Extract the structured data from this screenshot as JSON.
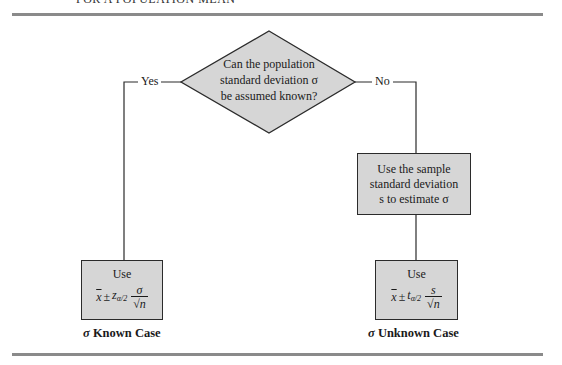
{
  "header": {
    "title": "FOR A POPULATION MEAN"
  },
  "decision": {
    "line1": "Can the population",
    "line2": "standard deviation σ",
    "line3": "be assumed known?"
  },
  "branches": {
    "yes_label": "Yes",
    "no_label": "No"
  },
  "process_box": {
    "line1": "Use the sample",
    "line2": "standard deviation",
    "line3": "s to estimate σ"
  },
  "known_case": {
    "use_label": "Use",
    "xbar": "x",
    "plusminus": "±",
    "critical_var": "z",
    "critical_sub": "α/2",
    "numerator": "σ",
    "sqrt_symbol": "√",
    "denominator_var": "n",
    "caption_symbol": "σ",
    "caption_text": "Known Case"
  },
  "unknown_case": {
    "use_label": "Use",
    "xbar": "x",
    "plusminus": "±",
    "critical_var": "t",
    "critical_sub": "α/2",
    "numerator": "s",
    "sqrt_symbol": "√",
    "denominator_var": "n",
    "caption_symbol": "σ",
    "caption_text": "Unknown Case"
  },
  "colors": {
    "box_fill": "#d6d6d6",
    "stroke": "#2b2b2b",
    "rule": "#8a8a8a"
  }
}
